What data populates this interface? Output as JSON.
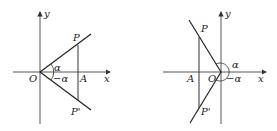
{
  "diagrams": [
    {
      "id": "left",
      "labels": {
        "y": "y",
        "x": "x",
        "origin": "O",
        "P": "P",
        "P_prime": "P'",
        "A": "A",
        "alpha": "α",
        "neg_alpha": "−α"
      }
    },
    {
      "id": "right",
      "labels": {
        "y": "y",
        "x": "x",
        "origin": "O",
        "P": "P",
        "P_prime": "P'",
        "A": "A",
        "alpha": "α",
        "neg_alpha": "−α"
      }
    }
  ]
}
